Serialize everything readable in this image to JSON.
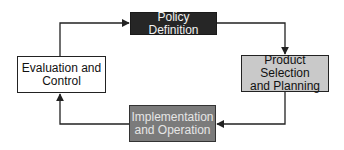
{
  "diagram": {
    "type": "cycle-flowchart",
    "nodes": [
      {
        "id": "policy",
        "label": "Policy Definition",
        "fill": "#262626",
        "text_color": "#f2f2f2"
      },
      {
        "id": "product",
        "label_line1": "Product Selection",
        "label_line2": "and Planning",
        "fill": "#c9c9c9",
        "text_color": "#111111"
      },
      {
        "id": "implementation",
        "label_line1": "Implementation",
        "label_line2": "and Operation",
        "fill": "#7b7b7b",
        "text_color": "#e6e6e6"
      },
      {
        "id": "evaluation",
        "label_line1": "Evaluation and",
        "label_line2": "Control",
        "fill": "#ffffff",
        "text_color": "#111111"
      }
    ],
    "edges": [
      {
        "from": "policy",
        "to": "product"
      },
      {
        "from": "product",
        "to": "implementation"
      },
      {
        "from": "implementation",
        "to": "evaluation"
      },
      {
        "from": "evaluation",
        "to": "policy"
      }
    ],
    "line_color": "#222222"
  }
}
